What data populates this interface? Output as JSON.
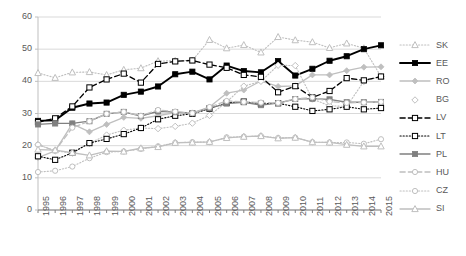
{
  "chart_data": {
    "type": "line",
    "title": "",
    "subtitle": "",
    "xlabel": "",
    "ylabel": "",
    "xlim": [
      1995,
      2015
    ],
    "ylim": [
      0,
      60
    ],
    "ytick_step": 10,
    "grid": true,
    "legend_position": "right",
    "categories": [
      "1995",
      "1996",
      "1997",
      "1998",
      "1999",
      "2000",
      "2001",
      "2002",
      "2003",
      "2004",
      "2005",
      "2006",
      "2007",
      "2008",
      "2009",
      "2010",
      "2011",
      "2012",
      "2013",
      "2014",
      "2015"
    ],
    "yticks": [
      "0",
      "10",
      "20",
      "30",
      "40",
      "50",
      "60"
    ],
    "series": [
      {
        "name": "SK",
        "marker": "triangle-open",
        "line_style": "dotted",
        "color": "#BFBFBF",
        "values": [
          42.6,
          41.1,
          42.8,
          42.9,
          42.0,
          43.6,
          44.1,
          46.3,
          46.4,
          46.5,
          52.9,
          50.3,
          51.3,
          49.0,
          53.8,
          52.8,
          52.2,
          50.4,
          51.8,
          50.3,
          41.5
        ]
      },
      {
        "name": "EE",
        "marker": "square-filled",
        "line_style": "solid",
        "color": "#000000",
        "values": [
          27.7,
          27.9,
          31.8,
          33.1,
          33.4,
          35.8,
          36.8,
          38.4,
          42.2,
          43.0,
          40.6,
          44.9,
          43.2,
          42.8,
          46.3,
          41.8,
          43.9,
          46.4,
          47.8,
          50.0,
          51.2
        ]
      },
      {
        "name": "RO",
        "marker": "diamond-filled",
        "line_style": "solid",
        "color": "#BFBFBF",
        "values": [
          16.3,
          18.4,
          26.8,
          24.3,
          26.6,
          28.8,
          28.5,
          29.3,
          30.3,
          30.2,
          32.0,
          36.3,
          37.3,
          40.1,
          38.4,
          38.6,
          42.0,
          42.0,
          43.3,
          44.4,
          44.5
        ]
      },
      {
        "name": "BG",
        "marker": "diamond-open",
        "line_style": "dotted",
        "color": "#BFBFBF",
        "values": [
          20.3,
          18.4,
          17.7,
          20.7,
          23.3,
          24.8,
          25.5,
          25.3,
          26.0,
          27.0,
          29.4,
          33.6,
          38.5,
          40.0,
          45.0,
          44.9,
          34.5,
          32.4,
          32.2,
          40.0,
          41.5
        ]
      },
      {
        "name": "LV",
        "marker": "square-open",
        "line_style": "dashed",
        "color": "#000000",
        "values": [
          27.3,
          28.5,
          32.2,
          38.1,
          40.6,
          42.4,
          39.6,
          45.4,
          46.2,
          46.5,
          45.2,
          44.2,
          42.0,
          41.4,
          36.6,
          38.5,
          35.0,
          37.0,
          41.0,
          40.3,
          41.5
        ]
      },
      {
        "name": "LT",
        "marker": "square-open",
        "line_style": "dotted",
        "color": "#000000",
        "values": [
          16.7,
          15.6,
          17.8,
          20.8,
          22.1,
          23.6,
          25.5,
          28.2,
          29.3,
          29.9,
          31.5,
          33.3,
          33.7,
          33.0,
          33.2,
          32.1,
          30.8,
          31.3,
          32.1,
          31.3,
          31.7
        ]
      },
      {
        "name": "PL",
        "marker": "square-filled",
        "line_style": "solid",
        "color": "#808080",
        "values": [
          26.6,
          26.9,
          26.9,
          27.6,
          29.9,
          30.5,
          29.2,
          30.7,
          30.4,
          30.1,
          31.7,
          33.1,
          33.5,
          32.6,
          33.2,
          34.5,
          34.6,
          34.4,
          33.5,
          33.5,
          33.6
        ]
      },
      {
        "name": "HU",
        "marker": "circle-open",
        "line_style": "dashed",
        "color": "#BFBFBF",
        "values": [
          20.3,
          18.4,
          25.6,
          27.6,
          29.9,
          30.5,
          29.3,
          31.1,
          30.6,
          30.1,
          32.0,
          33.9,
          33.6,
          33.4,
          33.3,
          34.5,
          35.0,
          33.7,
          33.3,
          33.4,
          33.6
        ]
      },
      {
        "name": "CZ",
        "marker": "circle-open",
        "line_style": "dotted",
        "color": "#BFBFBF",
        "values": [
          11.8,
          12.2,
          13.5,
          16.1,
          18.0,
          18.2,
          19.0,
          19.8,
          20.9,
          21.1,
          21.1,
          22.6,
          22.8,
          23.0,
          22.4,
          22.5,
          21.1,
          21.0,
          21.0,
          20.6,
          22.0
        ]
      },
      {
        "name": "SI",
        "marker": "triangle-open",
        "line_style": "solid",
        "color": "#BFBFBF",
        "values": [
          18.8,
          18.6,
          17.8,
          17.0,
          18.3,
          18.2,
          19.2,
          19.6,
          20.9,
          21.0,
          21.2,
          22.4,
          22.8,
          23.0,
          22.3,
          22.5,
          21.1,
          21.0,
          20.3,
          19.8,
          19.8
        ]
      }
    ]
  },
  "legend": {
    "items": [
      {
        "label": "SK"
      },
      {
        "label": "EE"
      },
      {
        "label": "RO"
      },
      {
        "label": "BG"
      },
      {
        "label": "LV"
      },
      {
        "label": "LT"
      },
      {
        "label": "PL"
      },
      {
        "label": "HU"
      },
      {
        "label": "CZ"
      },
      {
        "label": "SI"
      }
    ]
  }
}
